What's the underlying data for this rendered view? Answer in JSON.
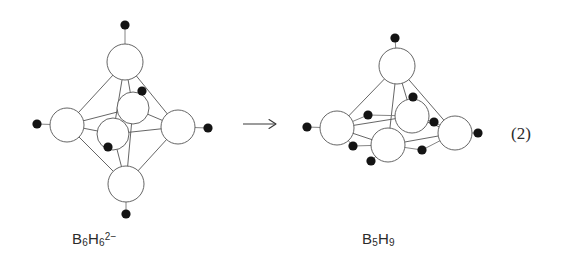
{
  "figure": {
    "type": "reaction-scheme",
    "equation_number": "(2)",
    "arrow": {
      "symbol": "→",
      "x1": 243,
      "y1": 124,
      "x2": 276,
      "y2": 124
    },
    "background_color": "#ffffff",
    "bond_color": "#555555",
    "hydrogen_color": "#141414",
    "vertex_fill": "#ffffff"
  },
  "reactant": {
    "name": "closo-hexahydrohexaborate dianion",
    "label_html": "B<sub>6</sub>H<sub>6</sub><sup>2−</sup>",
    "label_plain": "B6H6 2-",
    "geometry": "octahedron",
    "boron_count": 6,
    "terminal_hydrogen_count": 6,
    "bridging_hydrogen_count": 0,
    "borons": [
      {
        "id": "B-top",
        "x": 125,
        "y": 62,
        "r": 18
      },
      {
        "id": "B-left",
        "x": 67,
        "y": 125,
        "r": 17
      },
      {
        "id": "B-right",
        "x": 178,
        "y": 127,
        "r": 17
      },
      {
        "id": "B-rear-center",
        "x": 133,
        "y": 108,
        "r": 16
      },
      {
        "id": "B-front-center",
        "x": 113,
        "y": 134,
        "r": 16
      },
      {
        "id": "B-bottom",
        "x": 126,
        "y": 184,
        "r": 18
      }
    ],
    "bonds": [
      [
        "B-top",
        "B-left"
      ],
      [
        "B-top",
        "B-right"
      ],
      [
        "B-top",
        "B-rear-center"
      ],
      [
        "B-top",
        "B-front-center"
      ],
      [
        "B-left",
        "B-rear-center"
      ],
      [
        "B-left",
        "B-front-center"
      ],
      [
        "B-left",
        "B-bottom"
      ],
      [
        "B-right",
        "B-rear-center"
      ],
      [
        "B-right",
        "B-front-center"
      ],
      [
        "B-right",
        "B-bottom"
      ],
      [
        "B-bottom",
        "B-rear-center"
      ],
      [
        "B-bottom",
        "B-front-center"
      ]
    ],
    "terminal_hydrogens": [
      {
        "id": "H-top",
        "on": "B-top",
        "x": 125,
        "y": 25
      },
      {
        "id": "H-left",
        "on": "B-left",
        "x": 37,
        "y": 124
      },
      {
        "id": "H-right",
        "on": "B-right",
        "x": 208,
        "y": 128
      },
      {
        "id": "H-rear-center",
        "on": "B-rear-center",
        "x": 142,
        "y": 91
      },
      {
        "id": "H-front-center",
        "on": "B-front-center",
        "x": 108,
        "y": 147
      },
      {
        "id": "H-bottom",
        "on": "B-bottom",
        "x": 126,
        "y": 214
      }
    ]
  },
  "product": {
    "name": "pentaborane(9)",
    "label_html": "B<sub>5</sub>H<sub>9</sub>",
    "label_plain": "B5H9",
    "geometry": "square pyramid",
    "boron_count": 5,
    "terminal_hydrogen_count": 5,
    "bridging_hydrogen_count": 4,
    "borons": [
      {
        "id": "B-apex",
        "x": 397,
        "y": 66,
        "r": 18
      },
      {
        "id": "B-left",
        "x": 337,
        "y": 128,
        "r": 17
      },
      {
        "id": "B-rear",
        "x": 412,
        "y": 116,
        "r": 17
      },
      {
        "id": "B-front",
        "x": 388,
        "y": 145,
        "r": 17
      },
      {
        "id": "B-right",
        "x": 455,
        "y": 133,
        "r": 17
      }
    ],
    "bonds": [
      [
        "B-apex",
        "B-left"
      ],
      [
        "B-apex",
        "B-rear"
      ],
      [
        "B-apex",
        "B-front"
      ],
      [
        "B-apex",
        "B-right"
      ],
      [
        "B-left",
        "B-rear"
      ],
      [
        "B-rear",
        "B-right"
      ],
      [
        "B-right",
        "B-front"
      ],
      [
        "B-front",
        "B-left"
      ]
    ],
    "terminal_hydrogens": [
      {
        "id": "H-apex",
        "on": "B-apex",
        "x": 395,
        "y": 38
      },
      {
        "id": "H-left",
        "on": "B-left",
        "x": 307,
        "y": 127
      },
      {
        "id": "H-rear",
        "on": "B-rear",
        "x": 413,
        "y": 97
      },
      {
        "id": "H-front",
        "on": "B-front",
        "x": 371,
        "y": 161
      },
      {
        "id": "H-right",
        "on": "B-right",
        "x": 478,
        "y": 133
      }
    ],
    "bridging_hydrogens": [
      {
        "id": "Hb-left-rear",
        "between": [
          "B-left",
          "B-rear"
        ],
        "x": 368,
        "y": 115
      },
      {
        "id": "Hb-rear-right",
        "between": [
          "B-rear",
          "B-right"
        ],
        "x": 434,
        "y": 122
      },
      {
        "id": "Hb-right-front",
        "between": [
          "B-right",
          "B-front"
        ],
        "x": 422,
        "y": 150
      },
      {
        "id": "Hb-front-left",
        "between": [
          "B-front",
          "B-left"
        ],
        "x": 353,
        "y": 146
      }
    ]
  }
}
